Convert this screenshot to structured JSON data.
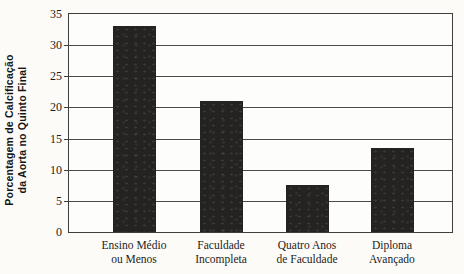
{
  "chart_data": {
    "type": "bar",
    "title": "",
    "categories": [
      "Ensino Médio ou Menos",
      "Faculdade Incompleta",
      "Quatro Anos de Faculdade",
      "Diploma Avançado"
    ],
    "category_lines": [
      [
        "Ensino Médio",
        "ou Menos"
      ],
      [
        "Faculdade",
        "Incompleta"
      ],
      [
        "Quatro Anos",
        "de Faculdade"
      ],
      [
        "Diploma",
        "Avançado"
      ]
    ],
    "values": [
      33,
      21,
      7.5,
      13.5
    ],
    "ylabel": "Porcentagem de Calcificação da Aorta no Quinto Final",
    "ylabel_lines": [
      "Porcentagem de Calcificação",
      "da Aorta no Quinto Final"
    ],
    "xlabel": "",
    "ylim": [
      0,
      35
    ],
    "yticks": [
      0,
      5,
      10,
      15,
      20,
      25,
      30,
      35
    ],
    "grid": true,
    "legend": "none",
    "colors": {
      "bar": "#242321",
      "frame": "#3e3e3c",
      "grid": "#4a4a48",
      "text": "#1c1c1a",
      "background": "#fcfbf8"
    }
  }
}
